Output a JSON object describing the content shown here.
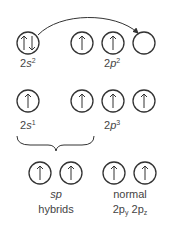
{
  "diagram": {
    "row1": {
      "s_orbital": {
        "electrons": "up-down",
        "label_base": "2",
        "label_orb": "s",
        "label_sup": "2"
      },
      "p_orbitals": [
        {
          "electrons": "up"
        },
        {
          "electrons": "up"
        },
        {
          "electrons": "empty"
        }
      ],
      "p_label_base": "2",
      "p_label_orb": "p",
      "p_label_sup": "2",
      "arrow": "promotion-arrow from 2s to empty 2p"
    },
    "row2": {
      "s_orbital": {
        "electrons": "up",
        "label_base": "2",
        "label_orb": "s",
        "label_sup": "1"
      },
      "p_orbitals": [
        {
          "electrons": "up"
        },
        {
          "electrons": "up"
        },
        {
          "electrons": "up"
        }
      ],
      "p_label_base": "2",
      "p_label_orb": "p",
      "p_label_sup": "3"
    },
    "row3": {
      "hybrid_label_1": "sp",
      "hybrid_label_2": "hybrids",
      "normal_label_1": "normal",
      "normal_label_2a": "2p",
      "normal_sub_a": "y",
      "normal_label_2b": "2p",
      "normal_sub_b": "z"
    },
    "colors": {
      "stroke": "#333333",
      "text": "#444444"
    }
  }
}
